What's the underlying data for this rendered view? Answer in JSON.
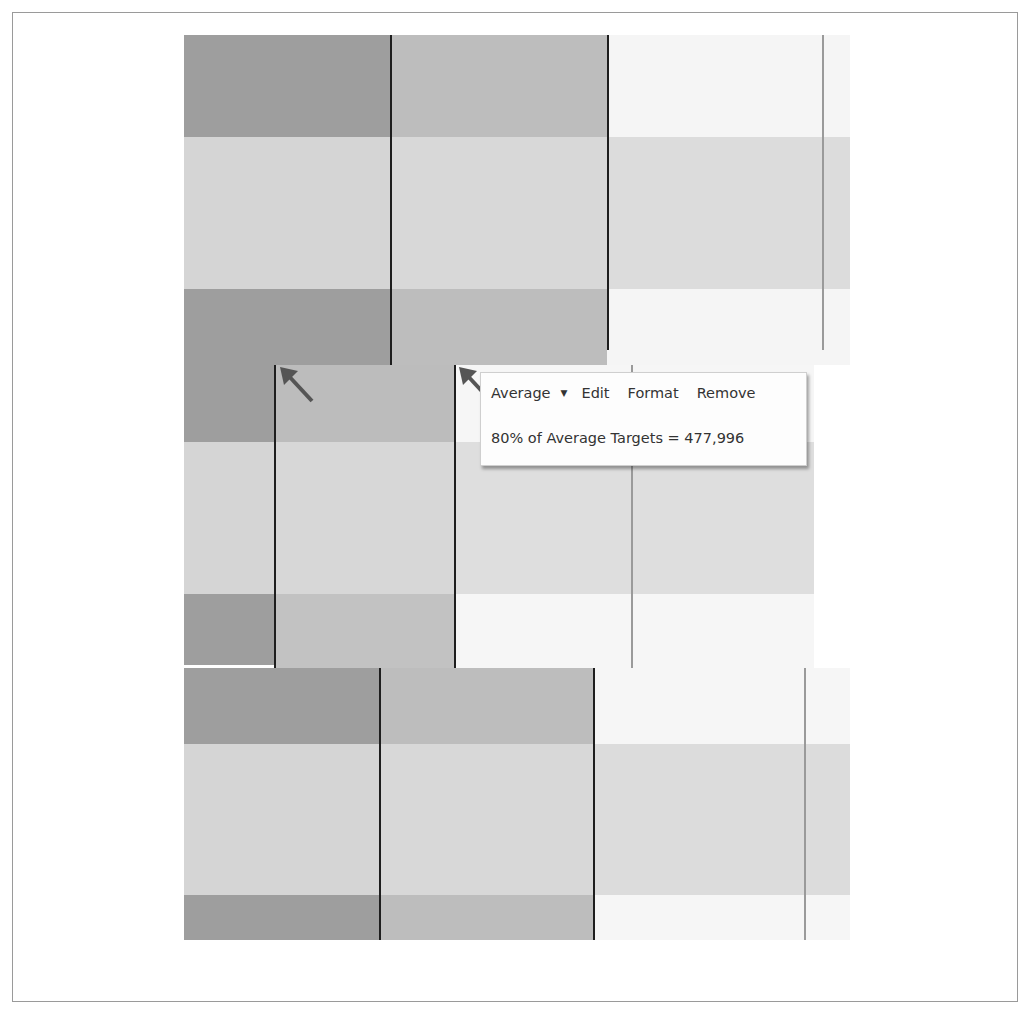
{
  "tooltip": {
    "menu": {
      "type_label": "Average",
      "dropdown_glyph": "▼",
      "edit_label": "Edit",
      "format_label": "Format",
      "remove_label": "Remove"
    },
    "value_text": "80% of Average Targets = 477,996"
  },
  "colors": {
    "band_dark": "#9d9d9d",
    "band_light": "#d6d6d6",
    "col2_dark": "#bebebe",
    "col2_light": "#d9d9d9",
    "col3_white": "#f6f6f6",
    "col3_light": "#dedede",
    "reference_line": "#1e1e1e",
    "callout_arrow": "#555555"
  }
}
